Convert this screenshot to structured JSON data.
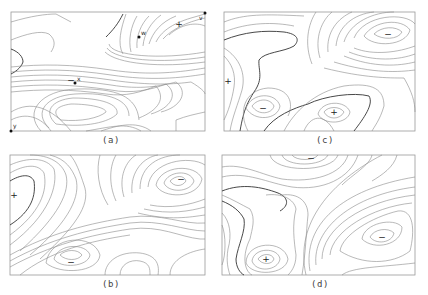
{
  "figure": {
    "panels": [
      {
        "id": "a",
        "caption": "(a)",
        "extremum_markers": [
          {
            "symbol": "+",
            "type": "maximum"
          },
          {
            "symbol": "−",
            "type": "minimum"
          }
        ],
        "point_labels": [
          "w",
          "x",
          "y",
          "v"
        ]
      },
      {
        "id": "b",
        "caption": "(b)",
        "extremum_markers": [
          {
            "symbol": "+",
            "type": "maximum"
          },
          {
            "symbol": "−",
            "type": "minimum"
          },
          {
            "symbol": "−",
            "type": "minimum"
          }
        ]
      },
      {
        "id": "c",
        "caption": "(c)",
        "extremum_markers": [
          {
            "symbol": "+",
            "type": "maximum"
          },
          {
            "symbol": "+",
            "type": "maximum"
          },
          {
            "symbol": "−",
            "type": "minimum"
          },
          {
            "symbol": "−",
            "type": "minimum"
          }
        ]
      },
      {
        "id": "d",
        "caption": "(d)",
        "extremum_markers": [
          {
            "symbol": "+",
            "type": "maximum"
          },
          {
            "symbol": "−",
            "type": "minimum"
          },
          {
            "symbol": "−",
            "type": "minimum"
          }
        ]
      }
    ],
    "labels": {
      "plus": "+",
      "minus": "−",
      "w": "w",
      "x": "x",
      "y": "y",
      "v": "v"
    }
  }
}
